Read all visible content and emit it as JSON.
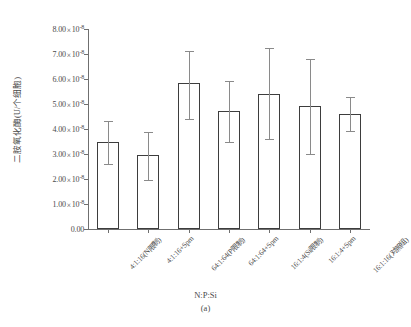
{
  "chart_data": {
    "type": "bar",
    "title": "",
    "caption": "(a)",
    "xlabel": "N:P:Si",
    "ylabel": "二胺氧化酶(U/个细胞)",
    "categories": [
      "4:1:16(N限制)",
      "4:1:16+Spm",
      "64:1:64(P限制)",
      "64:1:64+Spm",
      "16:1:4(Si限制)",
      "16:1:4+Spm",
      "16:1:16(对照组)"
    ],
    "values": [
      3.48e-08,
      2.95e-08,
      5.85e-08,
      4.72e-08,
      5.4e-08,
      4.92e-08,
      4.6e-08
    ],
    "errors_upper": [
      4.32e-08,
      3.88e-08,
      7.12e-08,
      5.92e-08,
      7.25e-08,
      6.8e-08,
      5.28e-08
    ],
    "errors_lower": [
      2.6e-08,
      1.96e-08,
      4.4e-08,
      3.48e-08,
      3.6e-08,
      3e-08,
      3.92e-08
    ],
    "ylim": [
      0,
      8e-08
    ],
    "ytick_values": [
      0,
      1e-08,
      2e-08,
      3e-08,
      4e-08,
      5e-08,
      6e-08,
      7e-08,
      8e-08
    ],
    "ytick_labels": [
      {
        "mantissa": "0.00",
        "exp": null
      },
      {
        "mantissa": "1.00",
        "exp": "-8"
      },
      {
        "mantissa": "2.00",
        "exp": "-8"
      },
      {
        "mantissa": "3.00",
        "exp": "-8"
      },
      {
        "mantissa": "4.00",
        "exp": "-8"
      },
      {
        "mantissa": "5.00",
        "exp": "-8"
      },
      {
        "mantissa": "6.00",
        "exp": "-8"
      },
      {
        "mantissa": "7.00",
        "exp": "-8"
      },
      {
        "mantissa": "8.00",
        "exp": "-8"
      }
    ],
    "times_symbol": "×",
    "base": "10",
    "grid": false,
    "legend": null,
    "bar_fill_color": "#ffffff",
    "bar_border_color": "#3d3d3d",
    "error_bar_color": "#8a8a8a",
    "axis_color": "#6f6f6f"
  }
}
